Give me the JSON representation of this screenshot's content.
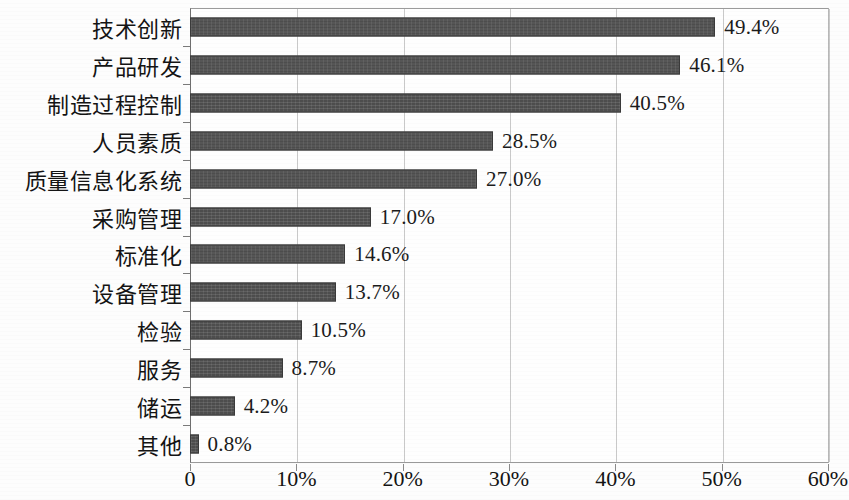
{
  "chart_data": {
    "type": "bar",
    "orientation": "horizontal",
    "title": "",
    "subtitle": "",
    "xlabel": "",
    "ylabel": "",
    "xlim": [
      0,
      60
    ],
    "grid": true,
    "legend": null,
    "legend_position": "none",
    "bar_color": "#4d4d4d",
    "value_suffix": "%",
    "x_ticks": [
      {
        "value": 0,
        "label": "0"
      },
      {
        "value": 10,
        "label": "10%"
      },
      {
        "value": 20,
        "label": "20%"
      },
      {
        "value": 30,
        "label": "30%"
      },
      {
        "value": 40,
        "label": "40%"
      },
      {
        "value": 50,
        "label": "50%"
      },
      {
        "value": 60,
        "label": "60%"
      }
    ],
    "categories": [
      "技术创新",
      "产品研发",
      "制造过程控制",
      "人员素质",
      "质量信息化系统",
      "采购管理",
      "标准化",
      "设备管理",
      "检验",
      "服务",
      "储运",
      "其他"
    ],
    "values": [
      49.4,
      46.1,
      40.5,
      28.5,
      27.0,
      17.0,
      14.6,
      13.7,
      10.5,
      8.7,
      4.2,
      0.8
    ],
    "value_labels": [
      "49.4%",
      "46.1%",
      "40.5%",
      "28.5%",
      "27.0%",
      "17.0%",
      "14.6%",
      "13.7%",
      "10.5%",
      "8.7%",
      "4.2%",
      "0.8%"
    ]
  }
}
